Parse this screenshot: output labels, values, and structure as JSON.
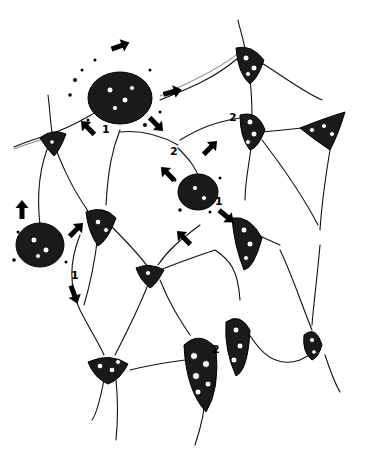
{
  "figure": {
    "background": "#ffffff",
    "ink_color": "#000000",
    "labels": [
      {
        "id": "label-1-top",
        "text": "1",
        "x": 102,
        "y": 124
      },
      {
        "id": "label-2-center",
        "text": "2",
        "x": 170,
        "y": 146
      },
      {
        "id": "label-2-upper-right",
        "text": "2",
        "x": 229,
        "y": 112
      },
      {
        "id": "label-1-center",
        "text": "1",
        "x": 215,
        "y": 196
      },
      {
        "id": "label-1-left",
        "text": "1",
        "x": 71,
        "y": 270
      },
      {
        "id": "label-2-bottom",
        "text": "2",
        "x": 212,
        "y": 344
      }
    ],
    "arrows": [
      {
        "id": "arrow-up-top",
        "x": 120,
        "y": 46,
        "angle": -20
      },
      {
        "id": "arrow-right-top",
        "x": 172,
        "y": 92,
        "angle": -15
      },
      {
        "id": "arrow-downleft-top",
        "x": 88,
        "y": 128,
        "angle": 225
      },
      {
        "id": "arrow-downright-top",
        "x": 156,
        "y": 124,
        "angle": 45
      },
      {
        "id": "arrow-upright-center",
        "x": 210,
        "y": 148,
        "angle": -45
      },
      {
        "id": "arrow-upleft-center",
        "x": 168,
        "y": 174,
        "angle": -135
      },
      {
        "id": "arrow-downright-center",
        "x": 226,
        "y": 216,
        "angle": 40
      },
      {
        "id": "arrow-downleft-center",
        "x": 184,
        "y": 238,
        "angle": 225
      },
      {
        "id": "arrow-up-left",
        "x": 22,
        "y": 210,
        "angle": -90
      },
      {
        "id": "arrow-upright-left",
        "x": 76,
        "y": 230,
        "angle": -45
      },
      {
        "id": "arrow-down-left",
        "x": 74,
        "y": 294,
        "angle": 70
      }
    ]
  }
}
